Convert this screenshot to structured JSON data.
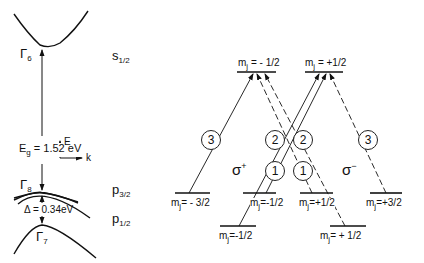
{
  "band_structure": {
    "conduction_band": {
      "label": "Γ",
      "sub": "6"
    },
    "heavy_light_hole": {
      "label": "Γ",
      "sub": "8"
    },
    "split_off": {
      "label": "Γ",
      "sub": "7"
    },
    "gap_label": "E",
    "gap_sub": "g",
    "gap_value": " = 1.52 eV",
    "split_label": "Δ = 0.34eV",
    "axis": {
      "E": "E",
      "k": "k"
    }
  },
  "state_labels": {
    "s": {
      "main": "s",
      "sub": "1/2"
    },
    "p32": {
      "main": "p",
      "sub": "3/2"
    },
    "p12": {
      "main": "p",
      "sub": "1/2"
    }
  },
  "levels": {
    "upper": [
      {
        "label": "m",
        "sub": "j",
        "value": " = - 1/2"
      },
      {
        "label": "m",
        "sub": "j",
        "value": " = +1/2"
      }
    ],
    "p32": [
      {
        "label": "m",
        "sub": "j",
        "value": "= - 3/2"
      },
      {
        "label": "m",
        "sub": "j",
        "value": "=-1/2"
      },
      {
        "label": "m",
        "sub": "j",
        "value": "=+1/2"
      },
      {
        "label": "m",
        "sub": "j",
        "value": "=+3/2"
      }
    ],
    "p12": [
      {
        "label": "m",
        "sub": "j",
        "value": "=-1/2"
      },
      {
        "label": "m",
        "sub": "j",
        "value": "= + 1/2"
      }
    ]
  },
  "polarization": {
    "sigma_plus": {
      "main": "σ",
      "sup": "+"
    },
    "sigma_minus": {
      "main": "σ",
      "sup": "−"
    }
  },
  "strengths": [
    "3",
    "2",
    "1",
    "1",
    "2",
    "3"
  ]
}
